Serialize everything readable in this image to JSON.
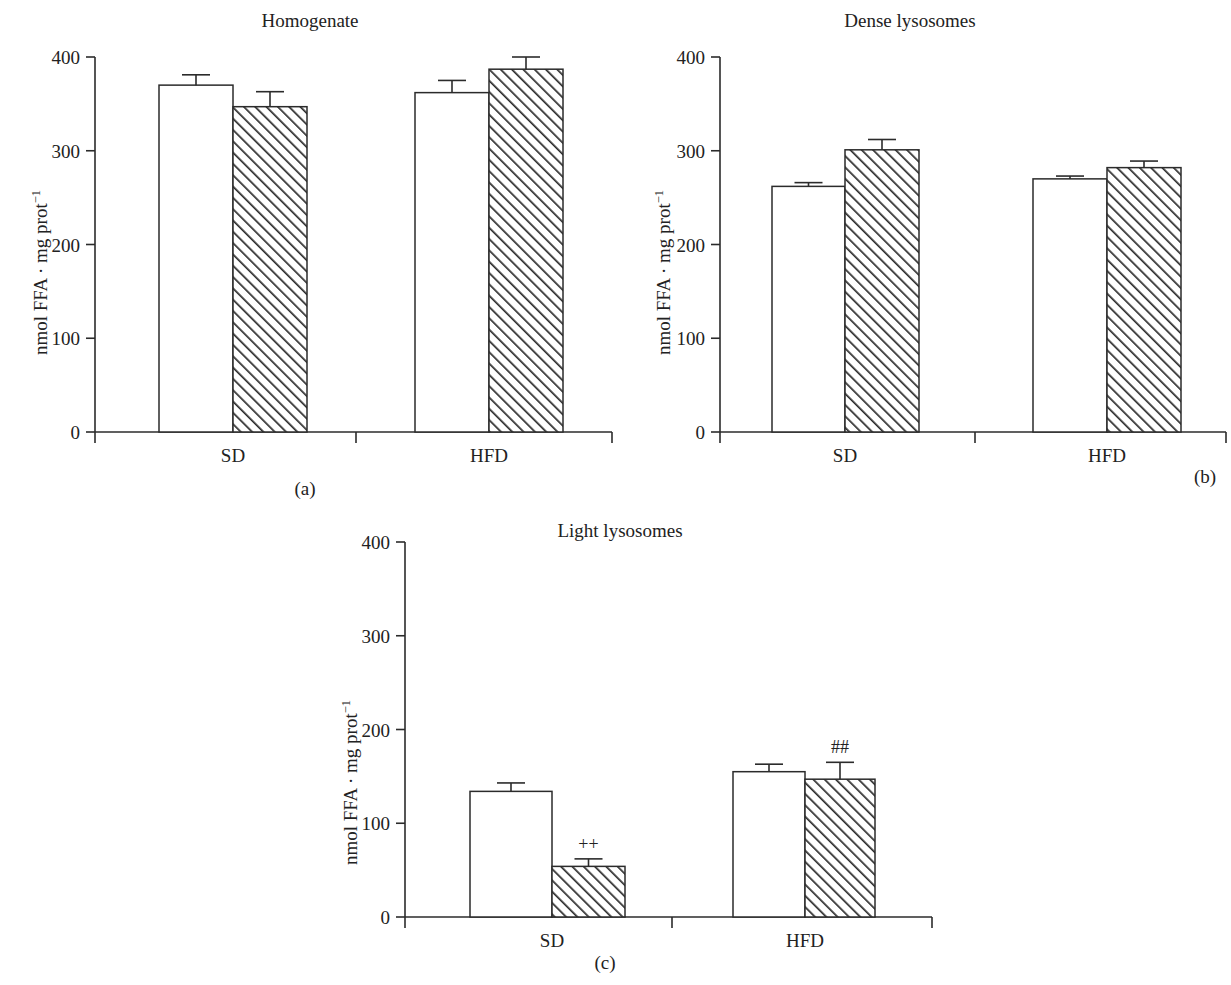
{
  "figure": {
    "ylabel": "nmol FFA · mg prot",
    "ylabel_sup": "−1",
    "axis": {
      "ticks": [
        "0",
        "100",
        "200",
        "300",
        "400"
      ],
      "tick_values": [
        0,
        100,
        200,
        300,
        400
      ],
      "ymin": 0,
      "ymax": 400
    },
    "categories": [
      "SD",
      "HFD"
    ],
    "series_names": [
      "open",
      "hatched"
    ],
    "colors": {
      "line": "#2b2b2b",
      "open_fill": "#ffffff",
      "hatch_fill": "#ffffff",
      "hatch_stroke": "#2b2b2b",
      "background": "#ffffff"
    }
  },
  "panels": [
    {
      "id": "a",
      "title": "Homogenate",
      "caption": "(a)",
      "ylabel": "nmol FFA · mg prot",
      "ylabel_sup": "−1",
      "xticklabels": [
        "SD",
        "HFD"
      ],
      "yticklabels": [
        "0",
        "100",
        "200",
        "300",
        "400"
      ]
    },
    {
      "id": "b",
      "title": "Dense lysosomes",
      "caption": "(b)",
      "ylabel": "nmol FFA · mg prot",
      "ylabel_sup": "−1",
      "xticklabels": [
        "SD",
        "HFD"
      ],
      "yticklabels": [
        "0",
        "100",
        "200",
        "300",
        "400"
      ]
    },
    {
      "id": "c",
      "title": "Light lysosomes",
      "caption": "(c)",
      "ylabel": "nmol FFA · mg prot",
      "ylabel_sup": "−1",
      "xticklabels": [
        "SD",
        "HFD"
      ],
      "yticklabels": [
        "0",
        "100",
        "200",
        "300",
        "400"
      ]
    }
  ],
  "chart_data": [
    {
      "type": "bar",
      "panel": "a",
      "title": "Homogenate",
      "caption": "(a)",
      "xlabel": "",
      "ylabel": "nmol FFA · mg prot⁻¹",
      "ylim": [
        0,
        400
      ],
      "yticks": [
        0,
        100,
        200,
        300,
        400
      ],
      "grid": false,
      "legend": "none",
      "categories": [
        "SD",
        "HFD"
      ],
      "series": [
        {
          "name": "open",
          "style": "open",
          "values": [
            370,
            362
          ],
          "errors": [
            11,
            13
          ],
          "significance": [
            "",
            ""
          ]
        },
        {
          "name": "hatched",
          "style": "hatched",
          "values": [
            347,
            387
          ],
          "errors": [
            16,
            13
          ],
          "significance": [
            "",
            ""
          ]
        }
      ]
    },
    {
      "type": "bar",
      "panel": "b",
      "title": "Dense lysosomes",
      "caption": "(b)",
      "xlabel": "",
      "ylabel": "nmol FFA · mg prot⁻¹",
      "ylim": [
        0,
        400
      ],
      "yticks": [
        0,
        100,
        200,
        300,
        400
      ],
      "grid": false,
      "legend": "none",
      "categories": [
        "SD",
        "HFD"
      ],
      "series": [
        {
          "name": "open",
          "style": "open",
          "values": [
            262,
            270
          ],
          "errors": [
            4,
            3
          ],
          "significance": [
            "",
            ""
          ]
        },
        {
          "name": "hatched",
          "style": "hatched",
          "values": [
            301,
            282
          ],
          "errors": [
            11,
            7
          ],
          "significance": [
            "",
            ""
          ]
        }
      ]
    },
    {
      "type": "bar",
      "panel": "c",
      "title": "Light lysosomes",
      "caption": "(c)",
      "xlabel": "",
      "ylabel": "nmol FFA · mg prot⁻¹",
      "ylim": [
        0,
        400
      ],
      "yticks": [
        0,
        100,
        200,
        300,
        400
      ],
      "grid": false,
      "legend": "none",
      "categories": [
        "SD",
        "HFD"
      ],
      "series": [
        {
          "name": "open",
          "style": "open",
          "values": [
            134,
            155
          ],
          "errors": [
            9,
            8
          ],
          "significance": [
            "",
            ""
          ]
        },
        {
          "name": "hatched",
          "style": "hatched",
          "values": [
            54,
            147
          ],
          "errors": [
            8,
            18
          ],
          "significance": [
            "++",
            "##"
          ]
        }
      ]
    }
  ]
}
